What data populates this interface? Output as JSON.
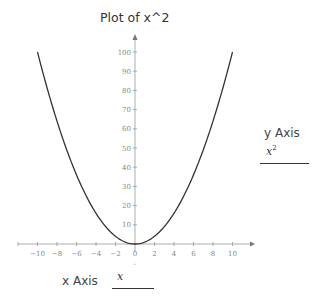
{
  "chart_data": {
    "type": "line",
    "title": "Plot of x^2",
    "xlabel": "x Axis",
    "ylabel": "y Axis",
    "x_expression": "x",
    "y_expression": "x^2",
    "xlim": [
      -12,
      11
    ],
    "ylim": [
      -5,
      108
    ],
    "x_ticks": [
      -10,
      -8,
      -6,
      -4,
      -2,
      0,
      2,
      4,
      6,
      8,
      10
    ],
    "y_ticks": [
      0,
      10,
      20,
      30,
      40,
      50,
      60,
      70,
      80,
      90,
      100
    ],
    "x_tick_labels": [
      "−10",
      "−8",
      "−6",
      "−4",
      "−2",
      "0",
      "2",
      "4",
      "6",
      "8",
      "10"
    ],
    "y_tick_labels": [
      "10",
      "20",
      "30",
      "40",
      "50",
      "60",
      "70",
      "80",
      "90",
      "100"
    ],
    "grid": false,
    "series": [
      {
        "name": "x^2",
        "x": [
          -10,
          -8,
          -6,
          -4,
          -2,
          0,
          2,
          4,
          6,
          8,
          10
        ],
        "values": [
          100,
          64,
          36,
          16,
          4,
          0,
          4,
          16,
          36,
          64,
          100
        ]
      }
    ]
  },
  "labels": {
    "title": "Plot of x^2",
    "y_axis_label": "y Axis",
    "y_expr_base": "x",
    "y_expr_exp": "2",
    "x_axis_label": "x Axis",
    "x_expr": "x"
  }
}
